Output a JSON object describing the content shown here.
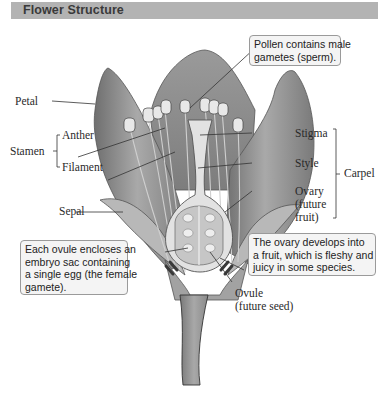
{
  "header": {
    "title": "Flower Structure",
    "background_color": "#b3b3b3"
  },
  "labels": {
    "petal": "Petal",
    "stamen": "Stamen",
    "anther": "Anther",
    "filament": "Filament",
    "sepal": "Sepal",
    "stigma": "Stigma",
    "style": "Style",
    "carpel": "Carpel",
    "ovary_line1": "Ovary",
    "ovary_line2": "(future",
    "ovary_line3": "fruit)",
    "ovule_line1": "Ovule",
    "ovule_line2": "(future seed)"
  },
  "callouts": {
    "pollen": [
      "Pollen contains male",
      "gametes (sperm)."
    ],
    "ovule": [
      "Each ovule encloses an",
      "embryo sac containing",
      "a single egg (the female",
      " gamete)."
    ],
    "ovary": [
      "The ovary develops into",
      "a fruit, which is fleshy and",
      "juicy in some species."
    ]
  },
  "colors": {
    "petal_fill": "#8f8f8f",
    "petal_dark": "#6e6e6e",
    "carpel_fill": "#e2e2e2",
    "callout_bg": "#f4f4f4",
    "callout_border": "#9a9a9a"
  }
}
